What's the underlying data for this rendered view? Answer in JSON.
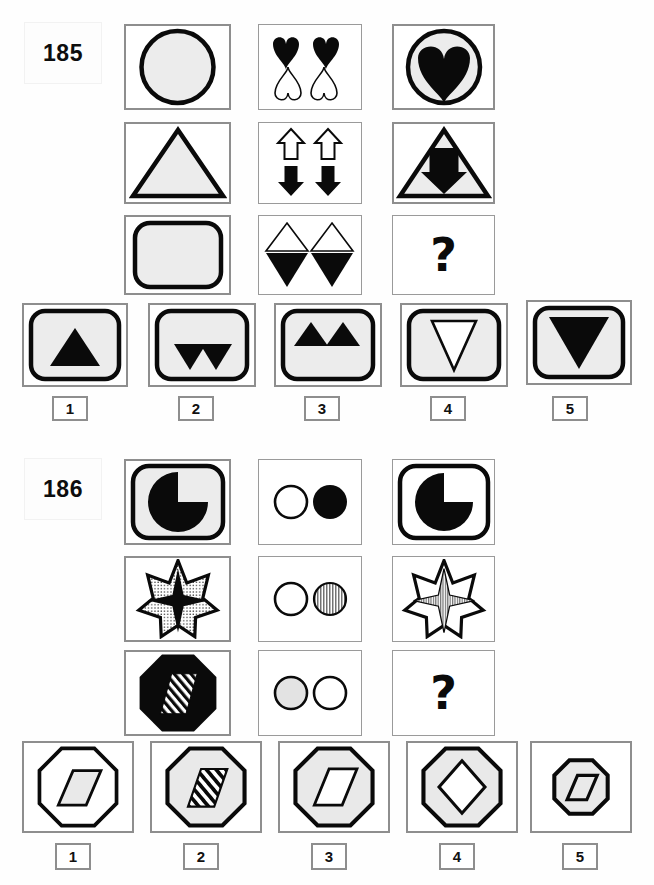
{
  "page": {
    "width": 654,
    "height": 885,
    "background": "#ffffff",
    "kind": "printed-matrix-reasoning-test-page",
    "colors": {
      "ink": "#0a0a0a",
      "frame": "#8e8e8e",
      "fill_light": "#e9e9e9",
      "paper": "#ffffff"
    }
  },
  "puzzles": [
    {
      "id": "185",
      "label": "185",
      "matrix": {
        "rows": 3,
        "cols": 3,
        "cells": [
          {
            "row": 1,
            "col": 1,
            "name": "cell-r1c1",
            "content": "large light-gray circle with thick black outline"
          },
          {
            "row": 1,
            "col": 2,
            "name": "cell-r1c2",
            "content": "two black hearts above two white outlined inverted hearts"
          },
          {
            "row": 1,
            "col": 3,
            "name": "cell-r1c3",
            "content": "light-gray circle with thick black outline containing a large solid black heart"
          },
          {
            "row": 2,
            "col": 1,
            "name": "cell-r2c1",
            "content": "light-gray triangle pointing up with thick black outline"
          },
          {
            "row": 2,
            "col": 2,
            "name": "cell-r2c2",
            "content": "two white outlined up arrows above two solid black down arrows"
          },
          {
            "row": 2,
            "col": 3,
            "name": "cell-r2c3",
            "content": "light-gray outlined triangle pointing up containing a solid black down arrow"
          },
          {
            "row": 3,
            "col": 1,
            "name": "cell-r3c1",
            "content": "light-gray rounded square with thick black outline"
          },
          {
            "row": 3,
            "col": 2,
            "name": "cell-r3c2",
            "content": "two white outlined up triangles above two solid black down triangles"
          },
          {
            "row": 3,
            "col": 3,
            "name": "cell-r3c3",
            "content": "?",
            "is_answer_slot": true,
            "marker": "?"
          }
        ]
      },
      "options": [
        {
          "number": "1",
          "name": "option-1",
          "content": "light-gray rounded square containing a solid black up triangle"
        },
        {
          "number": "2",
          "name": "option-2",
          "content": "light-gray rounded square containing two solid black down triangles"
        },
        {
          "number": "3",
          "name": "option-3",
          "content": "light-gray rounded square containing two solid black up triangles"
        },
        {
          "number": "4",
          "name": "option-4",
          "content": "light-gray rounded square containing a white outlined down triangle"
        },
        {
          "number": "5",
          "name": "option-5",
          "content": "light-gray rounded square containing a large solid black down triangle"
        }
      ]
    },
    {
      "id": "186",
      "label": "186",
      "matrix": {
        "rows": 3,
        "cols": 3,
        "cells": [
          {
            "row": 1,
            "col": 1,
            "name": "cell-r1c1",
            "content": "light-gray rounded square with thick black outline containing a black pac-man circle missing the upper-right quadrant"
          },
          {
            "row": 1,
            "col": 2,
            "name": "cell-r1c2",
            "content": "small white outlined circle beside a solid black circle"
          },
          {
            "row": 1,
            "col": 3,
            "name": "cell-r1c3",
            "content": "white rounded square with thick black outline containing a black pac-man circle missing the upper-right quadrant"
          },
          {
            "row": 2,
            "col": 1,
            "name": "cell-r2c1",
            "content": "seven-pointed dotted-fill star with a solid black four-pointed star inside"
          },
          {
            "row": 2,
            "col": 2,
            "name": "cell-r2c2",
            "content": "white outlined circle beside a vertically hatched gray circle"
          },
          {
            "row": 2,
            "col": 3,
            "name": "cell-r2c3",
            "content": "seven-pointed white star with a vertically hatched gray four-pointed star inside"
          },
          {
            "row": 3,
            "col": 1,
            "name": "cell-r3c1",
            "content": "solid black octagon with a diagonally striped parallelogram inside"
          },
          {
            "row": 3,
            "col": 2,
            "name": "cell-r3c2",
            "content": "light-gray filled circle beside a white outlined circle"
          },
          {
            "row": 3,
            "col": 3,
            "name": "cell-r3c3",
            "content": "?",
            "is_answer_slot": true,
            "marker": "?"
          }
        ]
      },
      "options": [
        {
          "number": "1",
          "name": "option-1",
          "content": "white octagon with a light-gray parallelogram inside"
        },
        {
          "number": "2",
          "name": "option-2",
          "content": "light-gray octagon with a diagonally striped parallelogram inside"
        },
        {
          "number": "3",
          "name": "option-3",
          "content": "light-gray octagon with a white parallelogram inside"
        },
        {
          "number": "4",
          "name": "option-4",
          "content": "light-gray octagon with a white diamond inside"
        },
        {
          "number": "5",
          "name": "option-5",
          "content": "small light-gray octagon with a light-gray parallelogram inside"
        }
      ]
    }
  ]
}
